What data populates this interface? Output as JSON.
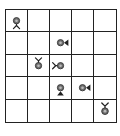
{
  "board": {
    "rows": 5,
    "cols": 5,
    "line_color": "#222222",
    "piece_color": "#6e6e6e",
    "pieces": [
      {
        "row": 0,
        "col": 0,
        "type": "legs",
        "direction": "down"
      },
      {
        "row": 1,
        "col": 2,
        "type": "triangle",
        "direction": "right"
      },
      {
        "row": 2,
        "col": 1,
        "type": "legs",
        "direction": "up"
      },
      {
        "row": 2,
        "col": 2,
        "type": "legs",
        "direction": "left"
      },
      {
        "row": 3,
        "col": 2,
        "type": "triangle",
        "direction": "down"
      },
      {
        "row": 3,
        "col": 3,
        "type": "triangle",
        "direction": "right"
      },
      {
        "row": 4,
        "col": 4,
        "type": "legs",
        "direction": "up"
      }
    ]
  }
}
